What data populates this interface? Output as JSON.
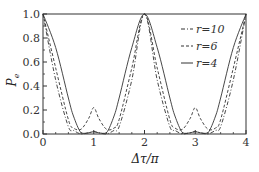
{
  "chart_data": {
    "type": "line",
    "title": "",
    "xlabel": "Δτ/π",
    "ylabel": "Pe",
    "xlim": [
      0,
      4
    ],
    "ylim": [
      0,
      1.0
    ],
    "xticks": [
      "0",
      "1",
      "2",
      "3",
      "4"
    ],
    "yticks": [
      "0.0",
      "0.2",
      "0.4",
      "0.6",
      "0.8",
      "1.0"
    ],
    "grid": false,
    "legend_position": "upper right",
    "x": [
      0,
      0.25,
      0.5,
      0.6,
      0.75,
      0.9,
      1.0,
      1.1,
      1.25,
      1.4,
      1.5,
      1.75,
      2.0,
      2.25,
      2.5,
      2.6,
      2.75,
      2.9,
      3.0,
      3.1,
      3.25,
      3.4,
      3.5,
      3.75,
      4.0
    ],
    "series": [
      {
        "name": "r=10",
        "style": "dash-dot",
        "values": [
          1.0,
          0.45,
          0.06,
          0.03,
          0.0,
          0.01,
          0.02,
          0.01,
          0.0,
          0.03,
          0.06,
          0.45,
          1.0,
          0.45,
          0.06,
          0.03,
          0.0,
          0.01,
          0.02,
          0.01,
          0.0,
          0.03,
          0.06,
          0.45,
          1.0
        ]
      },
      {
        "name": "r=6",
        "style": "dashed",
        "values": [
          1.0,
          0.55,
          0.12,
          0.05,
          0.04,
          0.13,
          0.22,
          0.13,
          0.04,
          0.05,
          0.12,
          0.55,
          1.0,
          0.55,
          0.12,
          0.05,
          0.04,
          0.13,
          0.22,
          0.13,
          0.04,
          0.05,
          0.12,
          0.55,
          1.0
        ]
      },
      {
        "name": "r=4",
        "style": "solid",
        "values": [
          1.0,
          0.72,
          0.3,
          0.15,
          0.01,
          0.01,
          0.02,
          0.01,
          0.01,
          0.15,
          0.3,
          0.72,
          1.0,
          0.72,
          0.3,
          0.15,
          0.01,
          0.01,
          0.02,
          0.01,
          0.01,
          0.15,
          0.3,
          0.72,
          1.0
        ]
      }
    ]
  },
  "legend": {
    "items": [
      {
        "label": "r=10",
        "style": "dash-dot"
      },
      {
        "label": "r=6",
        "style": "dashed"
      },
      {
        "label": "r=4",
        "style": "solid"
      }
    ]
  },
  "axes": {
    "xlabel": "Δτ/π",
    "ylabel_main": "P",
    "ylabel_sub": "e"
  },
  "colors": {
    "line": "#333333",
    "axis": "#333333",
    "background": "#ffffff"
  }
}
